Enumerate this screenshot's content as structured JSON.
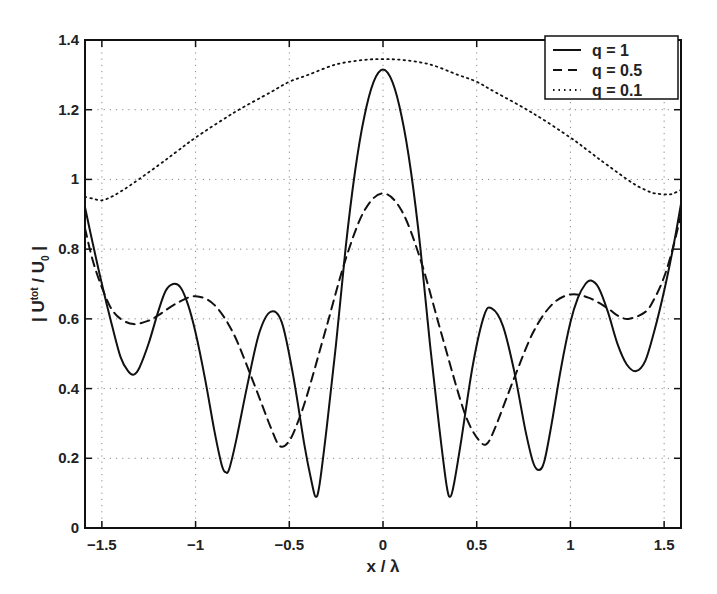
{
  "chart_data": {
    "type": "line",
    "title": "",
    "xlabel": "x / λ",
    "ylabel": "| U^tot / U_0 |",
    "ylabel_parts": {
      "open": "| U",
      "sup": "tot",
      "mid": " / U",
      "sub": "0",
      "close": " |"
    },
    "xlim": [
      -1.59,
      1.59
    ],
    "ylim": [
      0,
      1.4
    ],
    "grid": true,
    "legend_position": "upper right",
    "xticks": [
      -1.5,
      -1,
      -0.5,
      0,
      0.5,
      1,
      1.5
    ],
    "xtick_labels": [
      "−1.5",
      "−1",
      "−0.5",
      "0",
      "0.5",
      "1",
      "1.5"
    ],
    "yticks": [
      0,
      0.2,
      0.4,
      0.6,
      0.8,
      1,
      1.2,
      1.4
    ],
    "ytick_labels": [
      "0",
      "0.2",
      "0.4",
      "0.6",
      "0.8",
      "1",
      "1.2",
      "1.4"
    ],
    "series": [
      {
        "name": "q = 1",
        "style": "solid",
        "x": [
          -1.59,
          -1.55,
          -1.5,
          -1.45,
          -1.4,
          -1.36,
          -1.33,
          -1.3,
          -1.25,
          -1.2,
          -1.16,
          -1.12,
          -1.08,
          -1.04,
          -1.0,
          -0.95,
          -0.9,
          -0.86,
          -0.84,
          -0.82,
          -0.78,
          -0.72,
          -0.66,
          -0.6,
          -0.54,
          -0.48,
          -0.42,
          -0.38,
          -0.36,
          -0.34,
          -0.3,
          -0.25,
          -0.2,
          -0.15,
          -0.1,
          -0.05,
          0,
          0.05,
          0.1,
          0.15,
          0.2,
          0.25,
          0.3,
          0.34,
          0.36,
          0.38,
          0.42,
          0.48,
          0.54,
          0.58,
          0.64,
          0.7,
          0.76,
          0.8,
          0.83,
          0.86,
          0.9,
          0.95,
          1.0,
          1.04,
          1.08,
          1.11,
          1.15,
          1.2,
          1.25,
          1.3,
          1.35,
          1.4,
          1.45,
          1.5,
          1.55,
          1.59
        ],
        "y": [
          0.92,
          0.82,
          0.7,
          0.59,
          0.49,
          0.45,
          0.44,
          0.46,
          0.53,
          0.62,
          0.68,
          0.7,
          0.69,
          0.64,
          0.56,
          0.43,
          0.28,
          0.18,
          0.16,
          0.17,
          0.26,
          0.42,
          0.56,
          0.62,
          0.59,
          0.44,
          0.24,
          0.13,
          0.09,
          0.12,
          0.29,
          0.53,
          0.8,
          1.02,
          1.18,
          1.28,
          1.315,
          1.28,
          1.18,
          1.02,
          0.8,
          0.53,
          0.29,
          0.12,
          0.09,
          0.13,
          0.26,
          0.47,
          0.61,
          0.63,
          0.58,
          0.45,
          0.28,
          0.19,
          0.166,
          0.19,
          0.3,
          0.46,
          0.59,
          0.66,
          0.7,
          0.71,
          0.69,
          0.62,
          0.53,
          0.47,
          0.45,
          0.48,
          0.57,
          0.68,
          0.81,
          0.93
        ]
      },
      {
        "name": "q = 0.5",
        "style": "dashed",
        "x": [
          -1.59,
          -1.55,
          -1.5,
          -1.45,
          -1.4,
          -1.33,
          -1.25,
          -1.2,
          -1.1,
          -1.0,
          -0.9,
          -0.8,
          -0.7,
          -0.6,
          -0.55,
          -0.5,
          -0.45,
          -0.4,
          -0.3,
          -0.2,
          -0.1,
          0,
          0.1,
          0.2,
          0.3,
          0.4,
          0.45,
          0.5,
          0.55,
          0.6,
          0.7,
          0.8,
          0.9,
          1.0,
          1.1,
          1.2,
          1.25,
          1.31,
          1.4,
          1.45,
          1.5,
          1.55,
          1.59
        ],
        "y": [
          0.86,
          0.77,
          0.69,
          0.63,
          0.6,
          0.585,
          0.595,
          0.61,
          0.645,
          0.665,
          0.64,
          0.56,
          0.43,
          0.29,
          0.235,
          0.25,
          0.31,
          0.39,
          0.58,
          0.77,
          0.91,
          0.96,
          0.91,
          0.77,
          0.58,
          0.39,
          0.31,
          0.26,
          0.24,
          0.29,
          0.43,
          0.56,
          0.64,
          0.67,
          0.66,
          0.63,
          0.61,
          0.6,
          0.62,
          0.66,
          0.72,
          0.81,
          0.9
        ]
      },
      {
        "name": "q = 0.1",
        "style": "dotted",
        "x": [
          -1.59,
          -1.55,
          -1.5,
          -1.45,
          -1.4,
          -1.33,
          -1.2,
          -1.1,
          -1.0,
          -0.8,
          -0.6,
          -0.5,
          -0.4,
          -0.25,
          -0.1,
          0,
          0.1,
          0.25,
          0.4,
          0.5,
          0.6,
          0.8,
          1.0,
          1.1,
          1.2,
          1.33,
          1.4,
          1.45,
          1.52,
          1.55,
          1.59
        ],
        "y": [
          0.95,
          0.945,
          0.94,
          0.95,
          0.965,
          0.99,
          1.04,
          1.08,
          1.12,
          1.19,
          1.25,
          1.28,
          1.3,
          1.33,
          1.343,
          1.345,
          1.343,
          1.33,
          1.3,
          1.28,
          1.25,
          1.19,
          1.12,
          1.08,
          1.04,
          0.99,
          0.97,
          0.96,
          0.957,
          0.96,
          0.97
        ]
      }
    ]
  },
  "legend": {
    "items": [
      {
        "label": "q = 1",
        "style": "solid"
      },
      {
        "label": "q = 0.5",
        "style": "dashed"
      },
      {
        "label": "q = 0.1",
        "style": "dotted"
      }
    ]
  },
  "colors": {
    "line": "#111111",
    "axis": "#111111",
    "grid": "#888888",
    "background": "#ffffff"
  }
}
